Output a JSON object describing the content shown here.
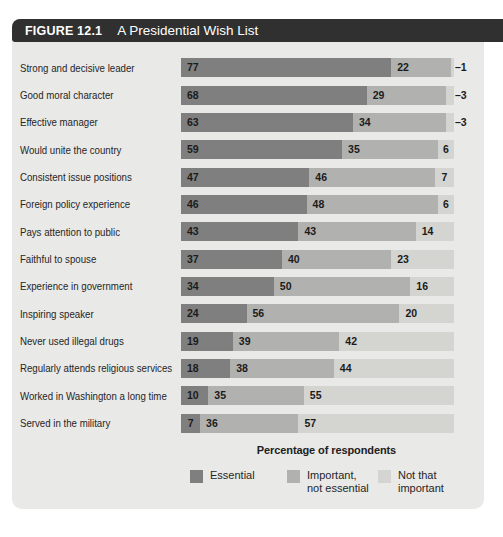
{
  "figure": {
    "label": "FIGURE 12.1",
    "title": "A Presidential Wish List"
  },
  "chart_data": {
    "type": "bar",
    "orientation": "horizontal",
    "stacked": true,
    "title": "A Presidential Wish List",
    "xlabel": "Percentage of respondents",
    "xlim": [
      0,
      100
    ],
    "grid": false,
    "legend_position": "bottom",
    "value_label_style": "inside-left; values under 5 labeled outside right with dash",
    "categories": [
      "Strong and decisive leader",
      "Good moral character",
      "Effective manager",
      "Would unite the country",
      "Consistent issue positions",
      "Foreign policy experience",
      "Pays attention to public",
      "Faithful to spouse",
      "Experience in government",
      "Inspiring speaker",
      "Never used illegal drugs",
      "Regularly attends religious services",
      "Worked in Washington a long time",
      "Served in the military"
    ],
    "series": [
      {
        "name": "Essential",
        "color": "#7f7f7f",
        "values": [
          77,
          68,
          63,
          59,
          47,
          46,
          43,
          37,
          34,
          24,
          19,
          18,
          10,
          7
        ]
      },
      {
        "name": "Important, not essential",
        "color": "#b1b1af",
        "values": [
          22,
          29,
          34,
          35,
          46,
          48,
          43,
          40,
          50,
          56,
          39,
          38,
          35,
          36
        ]
      },
      {
        "name": "Not that important",
        "color": "#d4d4d1",
        "values": [
          1,
          3,
          3,
          6,
          7,
          6,
          14,
          23,
          16,
          20,
          42,
          44,
          55,
          57
        ]
      }
    ],
    "legend": [
      {
        "lines": [
          "Essential"
        ]
      },
      {
        "lines": [
          "Important,",
          "not essential"
        ]
      },
      {
        "lines": [
          "Not that",
          "important"
        ]
      }
    ]
  },
  "colors": {
    "header_bg": "#303030",
    "header_text": "#ffffff",
    "panel_bg": "#e9e9e7",
    "essential": "#7f7f7f",
    "important_not_essential": "#b1b1af",
    "not_that_important": "#d4d4d1",
    "category_text": "#262626",
    "value_text": "#1b1b1b"
  }
}
